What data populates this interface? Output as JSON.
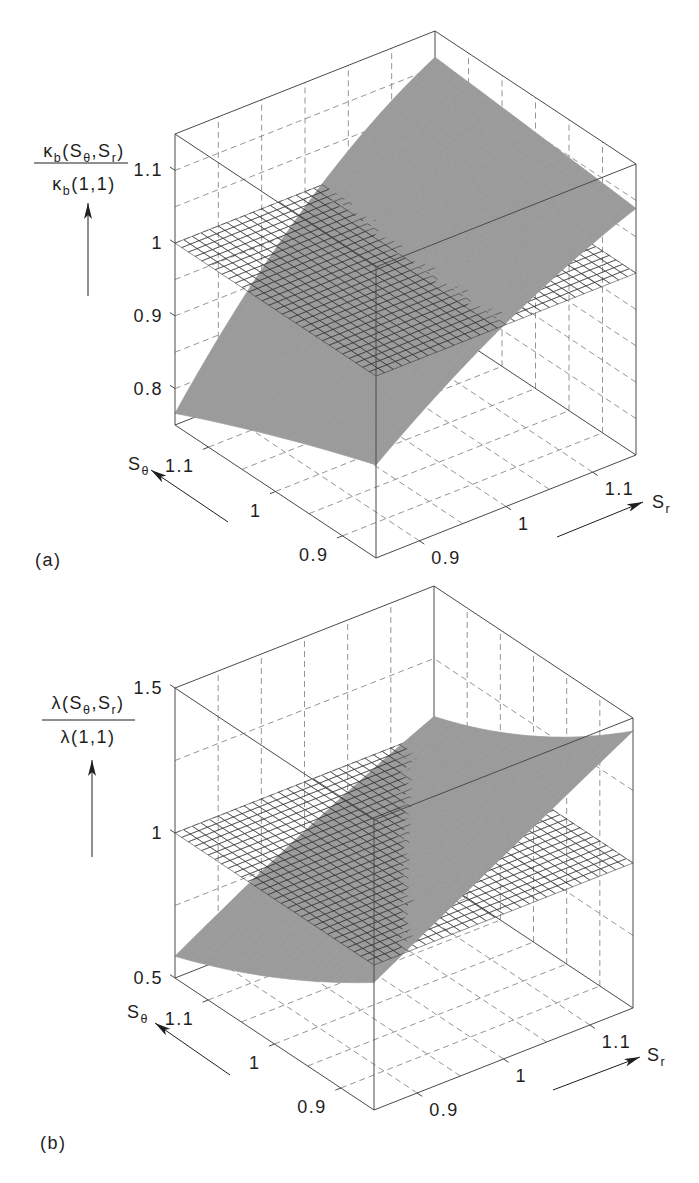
{
  "colors": {
    "background": "#ffffff",
    "surface": "#9b9b9b",
    "mesh": "#333333",
    "box": "#4a4a4a",
    "grid": "#7a7a7a",
    "text": "#1e1e1e"
  },
  "chart_data": [
    {
      "type": "surface3d",
      "panel_label": "(a)",
      "title": "",
      "zlabel": {
        "numerator": [
          {
            "t": "κ"
          },
          {
            "t": "b",
            "sub": true
          },
          {
            "t": "(S"
          },
          {
            "t": "θ",
            "sub": true
          },
          {
            "t": ",S"
          },
          {
            "t": "r",
            "sub": true
          },
          {
            "t": ")"
          }
        ],
        "denominator": [
          {
            "t": "κ"
          },
          {
            "t": "b",
            "sub": true
          },
          {
            "t": "(1,1)"
          }
        ]
      },
      "xlabel": [
        {
          "t": "S"
        },
        {
          "t": "θ",
          "sub": true
        }
      ],
      "ylabel": [
        {
          "t": "S"
        },
        {
          "t": "r",
          "sub": true
        }
      ],
      "xlim": [
        0.85,
        1.15
      ],
      "ylim": [
        0.85,
        1.15
      ],
      "zlim": [
        0.75,
        1.15
      ],
      "xticks": [
        0.9,
        1,
        1.1
      ],
      "xticklabels": [
        "0.9",
        "1",
        "1.1"
      ],
      "yticks": [
        0.9,
        1,
        1.1
      ],
      "yticklabels": [
        "0.9",
        "1",
        "1.1"
      ],
      "zticks": [
        0.8,
        0.9,
        1,
        1.1
      ],
      "zticklabels": [
        "0.8",
        "0.9",
        "1",
        "1.1"
      ],
      "grid": true,
      "grid_step": {
        "x": 0.05,
        "y": 0.05,
        "z": 0.05
      },
      "surface": {
        "x_variable": "S_theta",
        "y_variable": "S_r",
        "x": [
          0.85,
          1.0,
          1.15
        ],
        "y": [
          0.85,
          1.0,
          1.15
        ],
        "z": [
          [
            0.878,
            1.002,
            1.089
          ],
          [
            0.826,
            1.0,
            1.102
          ],
          [
            0.766,
            0.979,
            1.114
          ]
        ]
      },
      "reference_plane": {
        "z": 1,
        "style": "wire mesh"
      }
    },
    {
      "type": "surface3d",
      "panel_label": "(b)",
      "title": "",
      "zlabel": {
        "numerator": [
          {
            "t": "λ"
          },
          {
            "t": "(S"
          },
          {
            "t": "θ",
            "sub": true
          },
          {
            "t": ",S"
          },
          {
            "t": "r",
            "sub": true
          },
          {
            "t": ")"
          }
        ],
        "denominator": [
          {
            "t": "λ(1,1)"
          }
        ]
      },
      "xlabel": [
        {
          "t": "S"
        },
        {
          "t": "θ",
          "sub": true
        }
      ],
      "ylabel": [
        {
          "t": "S"
        },
        {
          "t": "r",
          "sub": true
        }
      ],
      "xlim": [
        0.85,
        1.15
      ],
      "ylim": [
        0.85,
        1.15
      ],
      "zlim": [
        0.5,
        1.5
      ],
      "xticks": [
        0.9,
        1,
        1.1
      ],
      "xticklabels": [
        "0.9",
        "1",
        "1.1"
      ],
      "yticks": [
        0.9,
        1,
        1.1
      ],
      "yticklabels": [
        "0.9",
        "1",
        "1.1"
      ],
      "zticks": [
        0.5,
        1,
        1.5
      ],
      "zticklabels": [
        "0.5",
        "1",
        "1.5"
      ],
      "grid": true,
      "grid_step": {
        "x": 0.05,
        "y": 0.05,
        "z": 0.25
      },
      "surface": {
        "x_variable": "S_theta",
        "y_variable": "S_r",
        "x": [
          0.85,
          1.0,
          1.15
        ],
        "y": [
          0.85,
          1.0,
          1.15
        ],
        "z": [
          [
            0.94,
            1.2,
            1.455
          ],
          [
            0.73,
            1.0,
            1.21
          ],
          [
            0.575,
            0.83,
            1.05
          ]
        ]
      },
      "reference_plane": {
        "z": 1,
        "style": "wire mesh"
      }
    }
  ]
}
